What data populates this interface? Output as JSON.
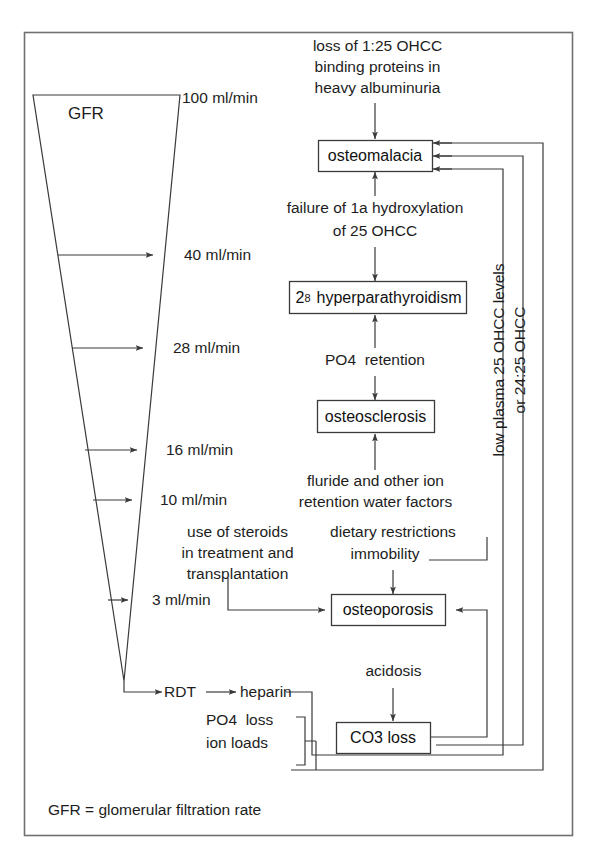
{
  "figure": {
    "title_note": "Renal osteodystrophy pathways related to declining GFR",
    "footnote": "GFR = glomerular filtration rate",
    "frame_color": "#6b6b6b",
    "line_color": "#3a3a3a",
    "text_color": "#1d1d1d",
    "background": "#ffffff"
  },
  "gfr_scale": {
    "label": "GFR",
    "units": "ml/min",
    "ticks": [
      {
        "value": "100",
        "text": "100 ml/min"
      },
      {
        "value": "40",
        "text": "40 ml/min"
      },
      {
        "value": "28",
        "text": "28 ml/min"
      },
      {
        "value": "16",
        "text": "16 ml/min"
      },
      {
        "value": "10",
        "text": "10 ml/min"
      },
      {
        "value": "3",
        "text": "3 ml/min"
      }
    ],
    "terminal": "RDT"
  },
  "boxes": [
    {
      "id": "osteomalacia",
      "label": "osteomalacia"
    },
    {
      "id": "hyperparathyroidism",
      "label_prefix": "2",
      "label_sub": "8",
      "label_main": "hyperparathyroidism",
      "label": "2₈ hyperparathyroidism"
    },
    {
      "id": "osteosclerosis",
      "label": "osteosclerosis"
    },
    {
      "id": "osteoporosis",
      "label": "osteoporosis"
    },
    {
      "id": "co3_loss",
      "label": "CO3 loss"
    }
  ],
  "free_text": [
    {
      "id": "albuminuria",
      "lines": [
        "loss of 1:25 OHCC",
        "binding proteins in",
        "heavy albuminuria"
      ]
    },
    {
      "id": "hydroxylation",
      "lines": [
        "failure of 1a hydroxylation",
        "of 25 OHCC"
      ]
    },
    {
      "id": "po4_retention",
      "lines": [
        "PO4  retention"
      ]
    },
    {
      "id": "fluoride",
      "lines": [
        "fluride and other ion",
        "retention water factors"
      ]
    },
    {
      "id": "steroids",
      "lines": [
        "use of steroids",
        "in treatment and",
        "transplantation"
      ]
    },
    {
      "id": "dietary",
      "lines": [
        "dietary restrictions",
        "immobility"
      ]
    },
    {
      "id": "acidosis",
      "lines": [
        "acidosis"
      ]
    },
    {
      "id": "heparin",
      "lines": [
        "heparin"
      ]
    },
    {
      "id": "rdt",
      "lines": [
        "RDT"
      ]
    },
    {
      "id": "po4_loss",
      "lines": [
        "PO4  loss",
        "ion loads"
      ]
    }
  ],
  "rotated_text": {
    "id": "low-plasma",
    "line1": "low plasma 25 OHCC levels",
    "line2": "or 24:25 OHCC"
  },
  "footnote": "GFR = glomerular filtration rate"
}
